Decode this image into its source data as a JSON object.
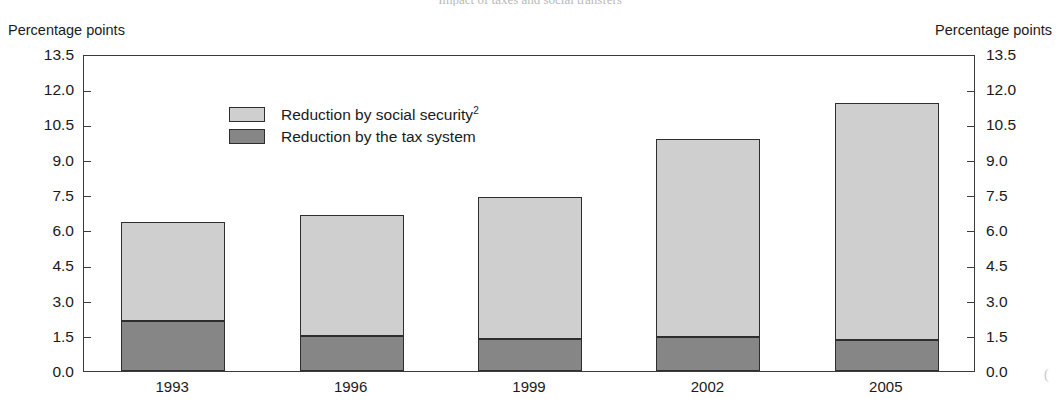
{
  "title": "Impact of taxes and social transfers",
  "axis_caption_left": "Percentage points",
  "axis_caption_right": "Percentage points",
  "legend": [
    {
      "label": "Reduction by social security",
      "superscript": "2",
      "color": "#cfcfcf",
      "key": "social_security"
    },
    {
      "label": "Reduction by the tax system",
      "superscript": "",
      "color": "#868686",
      "key": "tax_system"
    }
  ],
  "y_ticks": [
    "0.0",
    "1.5",
    "3.0",
    "4.5",
    "6.0",
    "7.5",
    "9.0",
    "10.5",
    "12.0",
    "13.5"
  ],
  "chart_data": {
    "type": "bar",
    "stacked": true,
    "title": "Impact of taxes and social transfers",
    "xlabel": "",
    "ylabel": "Percentage points",
    "ylim": [
      0.0,
      13.5
    ],
    "ytick_step": 1.5,
    "grid": false,
    "legend_position": "inside-top-center",
    "categories": [
      "1993",
      "1996",
      "1999",
      "2002",
      "2005"
    ],
    "series": [
      {
        "name": "Reduction by the tax system",
        "color": "#868686",
        "values": [
          2.15,
          1.5,
          1.35,
          1.45,
          1.3
        ]
      },
      {
        "name": "Reduction by social security",
        "color": "#cfcfcf",
        "values": [
          4.2,
          5.15,
          6.05,
          8.45,
          10.1
        ]
      }
    ],
    "totals": [
      6.35,
      6.65,
      7.4,
      9.9,
      11.4
    ]
  }
}
